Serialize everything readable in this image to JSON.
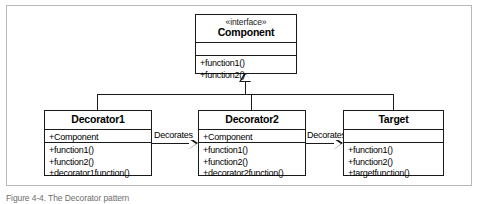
{
  "figure": {
    "caption": "Figure 4-4. The Decorator pattern"
  },
  "diagram": {
    "type": "uml-class-diagram",
    "classes": [
      {
        "id": "component",
        "stereotype": "«interface»",
        "name": "Component",
        "attributes": [],
        "operations": [
          "+function1()",
          "+function2()"
        ]
      },
      {
        "id": "decorator1",
        "stereotype": "",
        "name": "Decorator1",
        "attributes": [
          "+Component"
        ],
        "operations": [
          "+function1()",
          "+function2()",
          "+decorator1function()"
        ]
      },
      {
        "id": "decorator2",
        "stereotype": "",
        "name": "Decorator2",
        "attributes": [
          "+Component"
        ],
        "operations": [
          "+function1()",
          "+function2()",
          "+decorator2function()"
        ]
      },
      {
        "id": "target",
        "stereotype": "",
        "name": "Target",
        "attributes": [],
        "operations": [
          "+function1()",
          "+function2()",
          "+targetfunction()"
        ]
      }
    ],
    "associations": [
      {
        "id": "assoc1",
        "label": "Decorates",
        "from": "decorator1",
        "to": "decorator2",
        "arrow": "hollow-triangle-right"
      },
      {
        "id": "assoc2",
        "label": "Decorates",
        "from": "decorator2",
        "to": "target",
        "arrow": "hollow-triangle-right"
      }
    ],
    "generalizations": {
      "arrow": "hollow-triangle-up",
      "parent": "component",
      "children": [
        "decorator1",
        "decorator2",
        "target"
      ]
    },
    "colors": {
      "stroke": "#1a1a1a",
      "fill": "#ffffff",
      "frame": "#b9b9b9",
      "caption": "#6e6e6e"
    }
  }
}
